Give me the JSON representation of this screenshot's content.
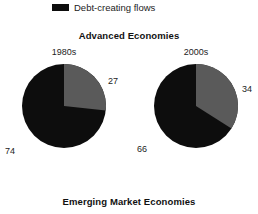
{
  "legend": {
    "swatch_icon": "legend-swatch-icon",
    "swatch_color": "#0d0d0d",
    "label": "Debt-creating flows"
  },
  "titles": {
    "main": "Advanced Economies",
    "caption": "Emerging Market Economies"
  },
  "colors": {
    "debt_creating": "#0d0d0d",
    "other": "#5a5a5a",
    "background": "#ffffff",
    "text": "#1c1c1c"
  },
  "panels": {
    "left": {
      "heading": "1980s",
      "gray_value": "27",
      "black_value": "74"
    },
    "right": {
      "heading": "2000s",
      "gray_value": "34",
      "black_value": "66"
    }
  },
  "chart_data": {
    "type": "pie",
    "title": "Advanced Economies",
    "subtitle": "Emerging Market Economies",
    "legend": [
      "Debt-creating flows"
    ],
    "legend_position": "top",
    "charts": [
      {
        "name": "1980s",
        "labels": [
          "Other flows",
          "Debt-creating flows"
        ],
        "values": [
          27,
          74
        ],
        "colors": [
          "#5a5a5a",
          "#0d0d0d"
        ],
        "start_angle": 0,
        "direction": "clockwise"
      },
      {
        "name": "2000s",
        "labels": [
          "Other flows",
          "Debt-creating flows"
        ],
        "values": [
          34,
          66
        ],
        "colors": [
          "#5a5a5a",
          "#0d0d0d"
        ],
        "start_angle": 0,
        "direction": "clockwise"
      }
    ]
  }
}
